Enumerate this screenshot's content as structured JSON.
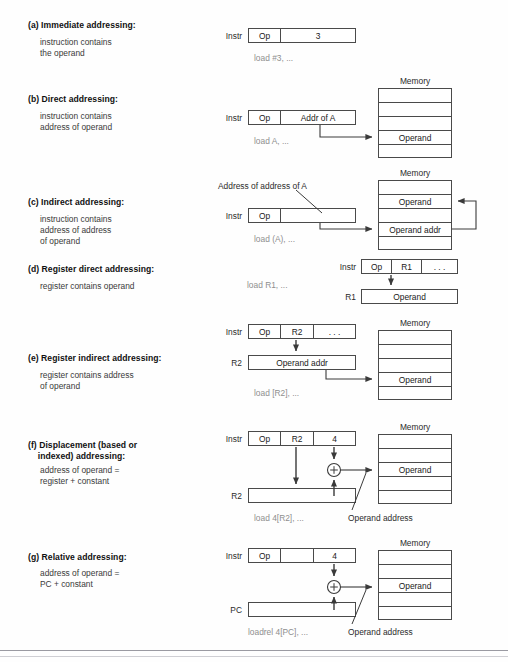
{
  "figure": {
    "kind": "addressing-modes-diagram",
    "memory_caption": "Memory",
    "instr_label": "Instr",
    "operand_text": "Operand",
    "operand_addr_text": "Operand addr",
    "operand_address_annotation": "Operand address",
    "ellipsis": ". . .",
    "plus_symbol": "+"
  },
  "sections": [
    {
      "id": "a",
      "title": "(a) Immediate addressing:",
      "desc_lines": [
        "instruction contains",
        "the operand"
      ],
      "code": "load #3, ...",
      "instr_label": "Instr",
      "instr_cells": [
        "Op",
        "3"
      ],
      "memory": null
    },
    {
      "id": "b",
      "title": "(b) Direct addressing:",
      "desc_lines": [
        "instruction contains",
        "address of operand"
      ],
      "code": "load A, ...",
      "instr_label": "Instr",
      "instr_cells": [
        "Op",
        "Addr of A"
      ],
      "memory": {
        "caption": "Memory",
        "rows": [
          "",
          "",
          "",
          "Operand",
          ""
        ]
      }
    },
    {
      "id": "c",
      "title": "(c) Indirect addressing:",
      "desc_lines": [
        "instruction contains",
        "address of address",
        "of operand"
      ],
      "code": "load (A), ...",
      "instr_label": "Instr",
      "instr_cells": [
        "Op",
        ""
      ],
      "callout": "Address of address of A",
      "memory": {
        "caption": "Memory",
        "rows": [
          "",
          "Operand",
          "",
          "Operand addr",
          ""
        ]
      }
    },
    {
      "id": "d",
      "title": "(d) Register direct addressing:",
      "desc_lines": [
        "register contains operand"
      ],
      "code": "load R1, ...",
      "instr_label": "Instr",
      "instr_cells": [
        "Op",
        "R1",
        ". . ."
      ],
      "register_label": "R1",
      "register_value": "Operand",
      "memory": null
    },
    {
      "id": "e",
      "title": "(e) Register indirect addressing:",
      "desc_lines": [
        "register contains address",
        "of operand"
      ],
      "code": "load [R2], ...",
      "instr_label": "Instr",
      "instr_cells": [
        "Op",
        "R2",
        ". . ."
      ],
      "register_label": "R2",
      "register_value": "Operand addr",
      "memory": {
        "caption": "Memory",
        "rows": [
          "",
          "",
          "",
          "Operand",
          ""
        ]
      }
    },
    {
      "id": "f",
      "title": "(f) Displacement (based or\n    indexed) addressing:",
      "desc_lines": [
        "address of operand =",
        "register + constant"
      ],
      "code": "load 4[R2], ...",
      "instr_label": "Instr",
      "instr_cells": [
        "Op",
        "R2",
        "4"
      ],
      "register_label": "R2",
      "register_value": "",
      "adder": "+",
      "annotation": "Operand address",
      "memory": {
        "caption": "Memory",
        "rows": [
          "",
          "",
          "Operand",
          "",
          ""
        ]
      }
    },
    {
      "id": "g",
      "title": "(g) Relative addressing:",
      "desc_lines": [
        "address of operand =",
        "PC + constant"
      ],
      "code": "loadrel 4[PC], ...",
      "instr_label": "Instr",
      "instr_cells": [
        "Op",
        "",
        "4"
      ],
      "register_label": "PC",
      "register_value": "",
      "adder": "+",
      "annotation": "Operand address",
      "memory": {
        "caption": "Memory",
        "rows": [
          "",
          "",
          "Operand",
          "",
          ""
        ]
      }
    }
  ],
  "colors": {
    "line": "#4a4a4a",
    "code_text": "#8e8e8e",
    "title_text": "#111111",
    "body_text": "#3a3a3a",
    "page_bg": "#fefefe"
  }
}
